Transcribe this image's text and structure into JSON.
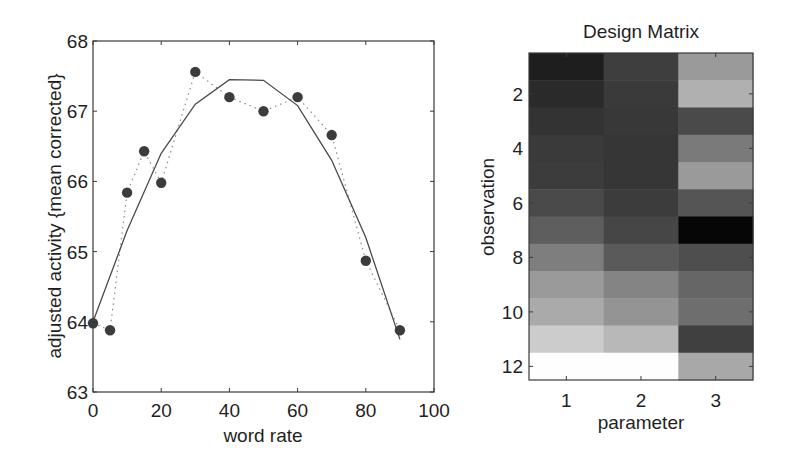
{
  "chart_data": [
    {
      "type": "line",
      "title": "",
      "xlabel": "word rate",
      "ylabel": "adjusted activity {mean corrected}",
      "xlim": [
        0,
        100
      ],
      "ylim": [
        63,
        68
      ],
      "xticks": [
        0,
        20,
        40,
        60,
        80,
        100
      ],
      "yticks": [
        63,
        64,
        65,
        66,
        67,
        68
      ],
      "grid": false,
      "legend": null,
      "x": [
        0,
        5,
        10,
        15,
        20,
        30,
        40,
        50,
        60,
        70,
        80,
        90
      ],
      "series": [
        {
          "name": "observed (adjusted data)",
          "style": "markers with dotted line",
          "x": [
            0,
            5,
            10,
            15,
            20,
            30,
            40,
            50,
            60,
            70,
            80,
            90
          ],
          "values": [
            63.98,
            63.88,
            65.84,
            66.43,
            65.98,
            67.56,
            67.2,
            67.0,
            67.2,
            66.66,
            64.87,
            63.88
          ]
        },
        {
          "name": "fitted response",
          "style": "solid line",
          "x": [
            0,
            10,
            20,
            30,
            40,
            50,
            60,
            70,
            80,
            90
          ],
          "values": [
            64.0,
            65.3,
            66.4,
            67.1,
            67.45,
            67.44,
            67.08,
            66.3,
            65.2,
            63.75
          ]
        }
      ]
    },
    {
      "type": "heatmap",
      "title": "Design Matrix",
      "xlabel": "parameter",
      "ylabel": "observation",
      "xticks": [
        1,
        2,
        3
      ],
      "yticks": [
        2,
        4,
        6,
        8,
        10,
        12
      ],
      "rows": 12,
      "cols": 3,
      "colormap": "gray",
      "cells": [
        [
          "#1e1e1e",
          "#3e3e3e",
          "#9a9a9a"
        ],
        [
          "#2a2a2a",
          "#3a3a3a",
          "#b0b0b0"
        ],
        [
          "#333333",
          "#383838",
          "#4a4a4a"
        ],
        [
          "#3a3a3a",
          "#363636",
          "#7a7a7a"
        ],
        [
          "#3c3c3c",
          "#363636",
          "#9a9a9a"
        ],
        [
          "#4a4a4a",
          "#3c3c3c",
          "#555555"
        ],
        [
          "#5e5e5e",
          "#464646",
          "#060606"
        ],
        [
          "#7e7e7e",
          "#5a5a5a",
          "#4e4e4e"
        ],
        [
          "#9a9a9a",
          "#848484",
          "#666666"
        ],
        [
          "#aaaaaa",
          "#949494",
          "#6e6e6e"
        ],
        [
          "#cccccc",
          "#b8b8b8",
          "#404040"
        ],
        [
          "#fefefe",
          "#fefefe",
          "#a8a8a8"
        ]
      ]
    }
  ],
  "left_plot": {
    "xlabel": "word rate",
    "ylabel": "adjusted activity {mean corrected}",
    "xtick_labels": [
      "0",
      "20",
      "40",
      "60",
      "80",
      "100"
    ],
    "ytick_labels": [
      "63",
      "64",
      "65",
      "66",
      "67",
      "68"
    ]
  },
  "right_plot": {
    "title": "Design Matrix",
    "xlabel": "parameter",
    "ylabel": "observation",
    "xtick_labels": [
      "1",
      "2",
      "3"
    ],
    "ytick_labels": [
      "2",
      "4",
      "6",
      "8",
      "10",
      "12"
    ]
  }
}
